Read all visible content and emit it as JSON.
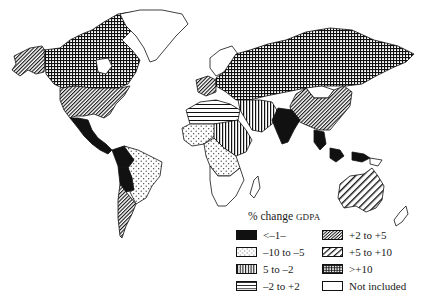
{
  "map": {
    "title": "% change GDPA",
    "colors": {
      "ink": "#111111",
      "paper": "#ffffff"
    }
  },
  "legend": {
    "title_main": "% change ",
    "title_small": "GDPA",
    "items": [
      {
        "label": "<–1–",
        "pattern": "solid-black"
      },
      {
        "label": "–10 to –5",
        "pattern": "dots"
      },
      {
        "label": "5 to –2",
        "pattern": "vertical-lines"
      },
      {
        "label": "–2 to +2",
        "pattern": "horizontal-lines"
      },
      {
        "label": "+2 to +5",
        "pattern": "dense-diagonal"
      },
      {
        "label": "+5 to +10",
        "pattern": "wide-diagonal"
      },
      {
        "label": ">+10",
        "pattern": "crosshatch-grid"
      },
      {
        "label": "Not included",
        "pattern": "blank"
      }
    ]
  },
  "regions": [
    {
      "name": "Alaska",
      "pattern": "dense-diagonal"
    },
    {
      "name": "Canada",
      "pattern": "crosshatch-grid"
    },
    {
      "name": "USA",
      "pattern": "dense-diagonal"
    },
    {
      "name": "Mexico & Central America",
      "pattern": "solid-black"
    },
    {
      "name": "Greenland",
      "pattern": "blank"
    },
    {
      "name": "Northern South America",
      "pattern": "solid-black"
    },
    {
      "name": "Brazil",
      "pattern": "dots"
    },
    {
      "name": "Bolivia",
      "pattern": "solid-black"
    },
    {
      "name": "Argentina & Chile",
      "pattern": "dense-diagonal"
    },
    {
      "name": "Scandinavia",
      "pattern": "blank"
    },
    {
      "name": "Russia",
      "pattern": "crosshatch-grid"
    },
    {
      "name": "Mongolia",
      "pattern": "blank"
    },
    {
      "name": "China",
      "pattern": "dense-diagonal"
    },
    {
      "name": "India",
      "pattern": "solid-black"
    },
    {
      "name": "Middle East",
      "pattern": "vertical-lines"
    },
    {
      "name": "North Africa",
      "pattern": "horizontal-lines"
    },
    {
      "name": "Sahel",
      "pattern": "vertical-lines"
    },
    {
      "name": "West Africa",
      "pattern": "dots"
    },
    {
      "name": "Central Africa",
      "pattern": "dots"
    },
    {
      "name": "Southern Africa",
      "pattern": "blank"
    },
    {
      "name": "Southeast Asia",
      "pattern": "solid-black"
    },
    {
      "name": "Indonesia",
      "pattern": "solid-black"
    },
    {
      "name": "Australia",
      "pattern": "wide-diagonal"
    },
    {
      "name": "New Zealand",
      "pattern": "blank"
    },
    {
      "name": "Madagascar",
      "pattern": "blank"
    }
  ]
}
